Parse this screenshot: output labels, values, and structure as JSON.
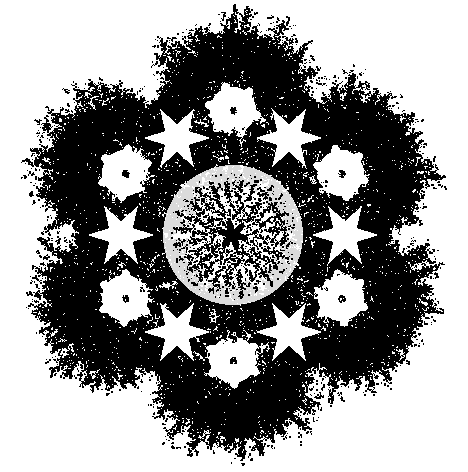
{
  "image": {
    "title": "Fractal Snowflake Kaleidoscope",
    "kind": "generative-fractal-artwork",
    "width": 468,
    "height": 472,
    "background_color": "#ffffff",
    "ink_color": "#000000",
    "symmetry_order": 6,
    "symmetry_type": "dihedral-D6",
    "style": "stippled high-contrast black and white line art"
  },
  "composition": {
    "center_x": 233,
    "center_y": 235,
    "bounds": {
      "left": 22,
      "top": 12,
      "right": 455,
      "bottom": 455
    },
    "overall_radius": 218,
    "layers": [
      {
        "name": "core-rosette",
        "radius": 14,
        "tone": "solid-black"
      },
      {
        "name": "inner-disc",
        "radius": 62,
        "tone": "light-stipple"
      },
      {
        "name": "inner-fingers",
        "radius": 96,
        "tone": "medium-stipple"
      },
      {
        "name": "white-voids",
        "radius": 118,
        "tone": "white-gap"
      },
      {
        "name": "outer-ring",
        "radius": 148,
        "tone": "dense-black"
      },
      {
        "name": "outer-spikes",
        "radius": 210,
        "tone": "feathery-spikes"
      }
    ]
  },
  "core_rosette": {
    "name": "central-dark-six-petal-rosette",
    "center_x": 233,
    "center_y": 235,
    "petal_count": 6,
    "petal_length": 15,
    "petal_width": 6.5,
    "twist_degrees": 14,
    "fill": "#000000"
  },
  "inner_disc": {
    "name": "inner-stippled-disc",
    "radius": 64,
    "density": 0.34,
    "dot_count": 2600,
    "dot_size": 1.5,
    "tone": "light"
  },
  "inner_fingers": {
    "name": "inner-radiating-fingers",
    "count": 18,
    "inner_radius": 52,
    "outer_radius": 100,
    "width": 9,
    "density": 0.55
  },
  "outer_clusters": {
    "name": "six-outer-snowflake-clusters",
    "count": 6,
    "orbit_radius": 125,
    "start_angle_degrees": -90,
    "cluster_radius": 92,
    "core_rosette": {
      "name": "white-six-petal-rosette-core",
      "radius": 21,
      "petal_count": 6,
      "petal_length": 20,
      "petal_width": 8,
      "fill": "#ffffff"
    },
    "spikes": {
      "count": 17,
      "inner_radius": 40,
      "outer_radius": 90,
      "width": 8.5
    },
    "centers": [
      {
        "label": "cluster-top",
        "x": 233,
        "y": 110
      },
      {
        "label": "cluster-upper-right",
        "x": 341,
        "y": 173
      },
      {
        "label": "cluster-lower-right",
        "x": 341,
        "y": 298
      },
      {
        "label": "cluster-bottom",
        "x": 233,
        "y": 360
      },
      {
        "label": "cluster-lower-left",
        "x": 125,
        "y": 298
      },
      {
        "label": "cluster-upper-left",
        "x": 125,
        "y": 173
      }
    ]
  },
  "dark_nodes": {
    "name": "dark-junction-blobs",
    "count": 12,
    "radius_small": 5,
    "radius_large": 8,
    "fill": "#000000",
    "orbit_radii": [
      92,
      148
    ]
  },
  "texture": {
    "name": "stipple-noise-texture",
    "total_dots": 26000,
    "min_dot": 0.8,
    "max_dot": 2.6,
    "seed": 20240617,
    "description": "dense random speckle dithering filling all branch bodies"
  },
  "white_voids": {
    "name": "white-star-shaped-gaps",
    "count": 6,
    "orbit_radius": 112,
    "size": 34,
    "points": 6
  }
}
